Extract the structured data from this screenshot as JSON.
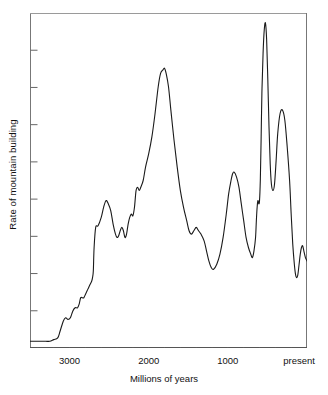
{
  "chart_data": {
    "type": "line",
    "title": "",
    "xlabel": "Millions of years",
    "ylabel": "Rate of mountain building",
    "xlim": [
      3500,
      0
    ],
    "ylim": [
      0,
      100
    ],
    "x_axis_reversed": true,
    "grid": false,
    "legend": null,
    "line_color": "#1a1a1a",
    "frame_color": "#4a4a4a",
    "background": "#ffffff",
    "x_tick_labels": [
      {
        "value": 3000,
        "text": "3000"
      },
      {
        "value": 2000,
        "text": "2000"
      },
      {
        "value": 1000,
        "text": "1000"
      },
      {
        "value": 100,
        "text": "present"
      }
    ],
    "x_minor_tick_values": [
      3400,
      3200,
      3000,
      2800,
      2600,
      2400,
      2200,
      2000,
      1800,
      1600,
      1400,
      1200,
      1000,
      800,
      600,
      400,
      200
    ],
    "y_tick_count": 8,
    "y_tick_labels": [],
    "series": [
      {
        "name": "Rate of mountain building",
        "x": [
          3500,
          3450,
          3400,
          3350,
          3300,
          3250,
          3200,
          3150,
          3120,
          3080,
          3050,
          3020,
          2990,
          2960,
          2930,
          2900,
          2880,
          2860,
          2840,
          2820,
          2800,
          2780,
          2760,
          2740,
          2720,
          2710,
          2700,
          2690,
          2670,
          2640,
          2600,
          2570,
          2540,
          2510,
          2480,
          2450,
          2420,
          2400,
          2380,
          2360,
          2340,
          2320,
          2300,
          2280,
          2260,
          2240,
          2220,
          2200,
          2180,
          2160,
          2140,
          2120,
          2100,
          2070,
          2040,
          2000,
          1960,
          1920,
          1880,
          1850,
          1820,
          1800,
          1780,
          1750,
          1720,
          1680,
          1640,
          1600,
          1560,
          1520,
          1490,
          1460,
          1430,
          1400,
          1370,
          1340,
          1300,
          1270,
          1240,
          1210,
          1180,
          1140,
          1100,
          1060,
          1020,
          990,
          960,
          940,
          920,
          890,
          860,
          830,
          800,
          770,
          740,
          710,
          690,
          670,
          650,
          640,
          630,
          620,
          610,
          600,
          590,
          580,
          570,
          555,
          540,
          525,
          510,
          495,
          480,
          465,
          450,
          430,
          410,
          390,
          370,
          340,
          310,
          280,
          250,
          220,
          200,
          180,
          160,
          145,
          130,
          115,
          100,
          85,
          70,
          55,
          40,
          20,
          0
        ],
        "y": [
          2,
          2,
          2,
          2,
          2,
          2,
          2.5,
          3,
          5,
          8,
          9,
          8.5,
          9,
          11,
          12,
          12,
          13,
          15,
          15,
          15,
          16,
          17,
          18,
          19,
          20,
          21,
          23,
          30,
          36,
          36.5,
          39,
          42,
          44,
          43,
          41,
          37,
          34,
          33,
          33.5,
          35,
          36,
          35,
          33,
          34,
          37,
          39,
          40,
          39.5,
          42,
          47,
          48,
          47,
          48,
          50,
          54,
          58,
          63,
          70,
          78,
          82,
          83,
          83.5,
          82,
          78,
          71,
          62,
          54,
          47,
          42,
          38,
          35,
          34,
          35,
          36,
          35,
          34,
          32,
          29,
          26,
          24,
          23.5,
          25,
          28,
          33,
          40,
          46,
          50,
          52,
          52.5,
          51,
          48,
          43,
          38,
          33,
          30,
          28,
          27,
          29,
          33,
          38,
          42,
          44,
          43,
          44,
          50,
          62,
          76,
          88,
          95,
          97,
          92,
          80,
          66,
          55,
          49,
          47,
          49,
          56,
          64,
          70,
          71,
          68,
          60,
          50,
          40,
          31,
          25,
          22,
          21,
          22,
          25,
          28,
          30,
          30.5,
          29,
          27,
          26
        ]
      }
    ]
  }
}
